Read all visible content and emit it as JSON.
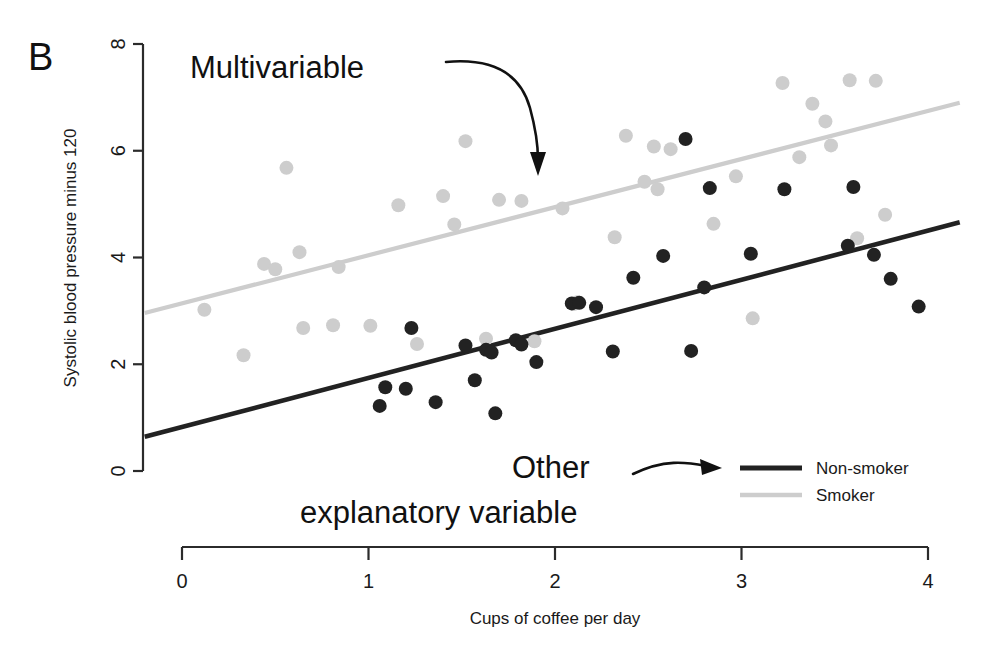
{
  "panel": {
    "label": "B"
  },
  "annotations": [
    {
      "name": "multivariable-annotation",
      "text": "Multivariable",
      "x": 190,
      "y": 78
    },
    {
      "name": "other-annotation-line1",
      "text": "Other",
      "x": 512,
      "y": 478
    },
    {
      "name": "other-annotation-line2",
      "text": "explanatory variable",
      "x": 300,
      "y": 523
    }
  ],
  "legend": {
    "position": "bottom-right",
    "items": [
      {
        "label": "Non-smoker",
        "color": "#222222"
      },
      {
        "label": "Smoker",
        "color": "#cdcdcd"
      }
    ]
  },
  "chart_data": {
    "type": "scatter",
    "title": "",
    "xlabel": "Cups of coffee per day",
    "ylabel": "Systolic blood pressure minus 120",
    "xlim": [
      0,
      4
    ],
    "ylim": [
      0,
      8
    ],
    "xticks": [
      0,
      1,
      2,
      3,
      4
    ],
    "yticks": [
      0,
      2,
      4,
      6,
      8
    ],
    "xtick_labels": [
      "0",
      "1",
      "2",
      "3",
      "4"
    ],
    "ytick_labels": [
      "0",
      "2",
      "4",
      "6",
      "8"
    ],
    "grid": false,
    "legend_position": "bottom-right",
    "series": [
      {
        "name": "Smoker",
        "color": "#cdcdcd",
        "marker": "circle",
        "points": [
          [
            0.12,
            3.02
          ],
          [
            0.33,
            2.17
          ],
          [
            0.44,
            3.88
          ],
          [
            0.5,
            3.78
          ],
          [
            0.56,
            5.68
          ],
          [
            0.63,
            4.1
          ],
          [
            0.65,
            2.68
          ],
          [
            0.81,
            2.73
          ],
          [
            0.84,
            3.82
          ],
          [
            1.01,
            2.72
          ],
          [
            1.16,
            4.98
          ],
          [
            1.26,
            2.38
          ],
          [
            1.4,
            5.15
          ],
          [
            1.46,
            4.62
          ],
          [
            1.52,
            6.18
          ],
          [
            1.63,
            2.48
          ],
          [
            1.7,
            5.08
          ],
          [
            1.82,
            5.06
          ],
          [
            1.89,
            2.43
          ],
          [
            2.04,
            4.92
          ],
          [
            2.1,
            3.13
          ],
          [
            2.12,
            3.16
          ],
          [
            2.32,
            4.38
          ],
          [
            2.38,
            6.28
          ],
          [
            2.48,
            5.42
          ],
          [
            2.53,
            6.08
          ],
          [
            2.55,
            5.28
          ],
          [
            2.62,
            6.03
          ],
          [
            2.85,
            4.63
          ],
          [
            2.97,
            5.52
          ],
          [
            3.06,
            2.86
          ],
          [
            3.22,
            7.27
          ],
          [
            3.31,
            5.88
          ],
          [
            3.38,
            6.88
          ],
          [
            3.45,
            6.55
          ],
          [
            3.48,
            6.1
          ],
          [
            3.58,
            7.32
          ],
          [
            3.62,
            4.36
          ],
          [
            3.72,
            7.31
          ],
          [
            3.77,
            4.8
          ]
        ]
      },
      {
        "name": "Non-smoker",
        "color": "#222222",
        "marker": "circle",
        "points": [
          [
            1.06,
            1.22
          ],
          [
            1.09,
            1.57
          ],
          [
            1.2,
            1.54
          ],
          [
            1.23,
            2.68
          ],
          [
            1.36,
            1.29
          ],
          [
            1.52,
            2.35
          ],
          [
            1.57,
            1.7
          ],
          [
            1.63,
            2.27
          ],
          [
            1.66,
            2.22
          ],
          [
            1.68,
            1.08
          ],
          [
            1.79,
            2.45
          ],
          [
            1.82,
            2.37
          ],
          [
            1.9,
            2.04
          ],
          [
            2.09,
            3.14
          ],
          [
            2.13,
            3.15
          ],
          [
            2.22,
            3.07
          ],
          [
            2.31,
            2.24
          ],
          [
            2.42,
            3.62
          ],
          [
            2.58,
            4.03
          ],
          [
            2.7,
            6.22
          ],
          [
            2.73,
            2.25
          ],
          [
            2.8,
            3.44
          ],
          [
            2.83,
            5.3
          ],
          [
            3.05,
            4.07
          ],
          [
            3.23,
            5.28
          ],
          [
            3.57,
            4.22
          ],
          [
            3.6,
            5.32
          ],
          [
            3.71,
            4.05
          ],
          [
            3.8,
            3.6
          ],
          [
            3.95,
            3.08
          ]
        ]
      }
    ],
    "fit_lines": [
      {
        "name": "Smoker",
        "color": "#cdcdcd",
        "x0": -0.2,
        "y0": 2.96,
        "x1": 4.17,
        "y1": 6.9
      },
      {
        "name": "Non-smoker",
        "color": "#222222",
        "x0": -0.2,
        "y0": 0.64,
        "x1": 4.17,
        "y1": 4.66
      }
    ]
  }
}
